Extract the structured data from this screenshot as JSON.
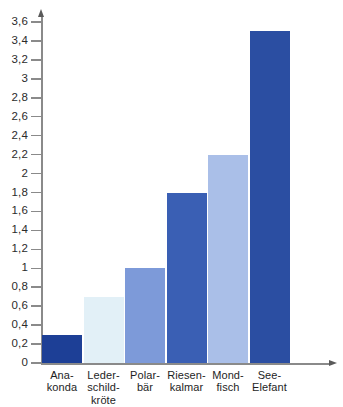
{
  "chart_data": {
    "type": "bar",
    "title": "",
    "subtitle": "",
    "xlabel": "",
    "ylabel": "",
    "categories": [
      "Ana-konda",
      "Leder-schild-kröte",
      "Polar-bär",
      "Riesen-kalmar",
      "Mond-fisch",
      "See-Elefant"
    ],
    "category_lines": [
      [
        "Ana-",
        "konda"
      ],
      [
        "Leder-",
        "schild-",
        "kröte"
      ],
      [
        "Polar-",
        "bär"
      ],
      [
        "Riesen-",
        "kalmar"
      ],
      [
        "Mond-",
        "fisch"
      ],
      [
        "See-",
        "Elefant"
      ]
    ],
    "values": [
      0.3,
      0.7,
      1.0,
      1.8,
      2.2,
      3.5
    ],
    "value_labels": [
      "0,3",
      "0,7",
      "1",
      "1,8",
      "2,2",
      "3,5"
    ],
    "bar_colors": [
      "#1d3f96",
      "#e2f0f7",
      "#7d9ad9",
      "#3a5fb4",
      "#aabfe8",
      "#2b4ea2"
    ],
    "ylim": [
      0,
      3.6
    ],
    "ytick_step": 0.2,
    "ytick_values": [
      0,
      0.2,
      0.4,
      0.6,
      0.8,
      1,
      1.2,
      1.4,
      1.6,
      1.8,
      2,
      2.2,
      2.4,
      2.6,
      2.8,
      3,
      3.2,
      3.4,
      3.6
    ],
    "ytick_labels": [
      "0",
      "0,2",
      "0,4",
      "0,6",
      "0,8",
      "1",
      "1,2",
      "1,4",
      "1,6",
      "1,8",
      "2",
      "2,2",
      "2,4",
      "2,6",
      "2,8",
      "3",
      "3,2",
      "3,4",
      "3,6"
    ],
    "grid": false,
    "legend": null,
    "axis_color": "#8a8a8a",
    "background_color": "#ffffff"
  }
}
